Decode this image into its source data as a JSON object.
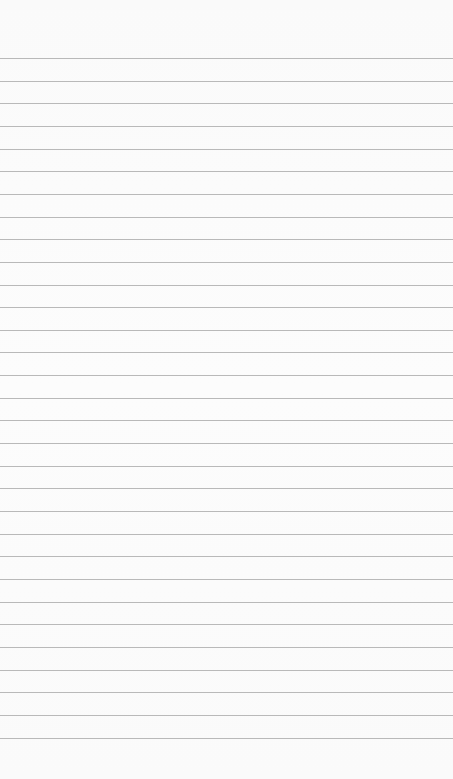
{
  "page": {
    "type": "lined-paper",
    "background_color": "#fbfbfb",
    "line_color": "#b9b9b9",
    "first_line_y": 58,
    "line_spacing": 22.65,
    "line_count": 31,
    "text": ""
  }
}
